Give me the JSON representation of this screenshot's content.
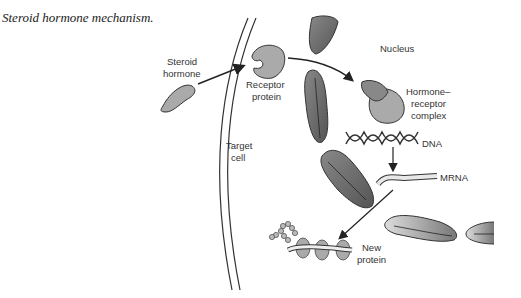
{
  "caption": "Steroid hormone mechanism.",
  "labels": {
    "steroid_hormone": [
      "Steroid",
      "hormone"
    ],
    "receptor_protein": [
      "Receptor",
      "protein"
    ],
    "nucleus": "Nucleus",
    "complex": [
      "Hormone–",
      "receptor",
      "complex"
    ],
    "dna": "DNA",
    "target_cell": [
      "Target",
      "cell"
    ],
    "mrna": "MRNA",
    "new_protein": [
      "New",
      "protein"
    ]
  }
}
